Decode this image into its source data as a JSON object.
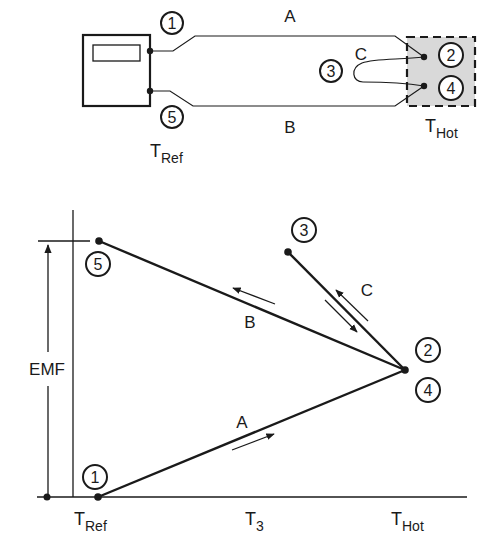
{
  "top_circuit": {
    "wire_labels": {
      "a": "A",
      "b": "B",
      "c": "C"
    },
    "points": {
      "p1": "1",
      "p2": "2",
      "p3": "3",
      "p4": "4",
      "p5": "5"
    },
    "ref_label": {
      "main": "T",
      "sub": "Ref"
    },
    "hot_label": {
      "main": "T",
      "sub": "Hot"
    }
  },
  "graph": {
    "y_axis_label": "EMF",
    "segment_labels": {
      "a": "A",
      "b": "B",
      "c": "C"
    },
    "points": {
      "p1": "1",
      "p2": "2",
      "p3": "3",
      "p4": "4",
      "p5": "5"
    },
    "x_ticks": [
      {
        "main": "T",
        "sub": "Ref"
      },
      {
        "main": "T",
        "sub": "3"
      },
      {
        "main": "T",
        "sub": "Hot"
      }
    ]
  },
  "colors": {
    "ink": "#1a1a1a",
    "hot_zone_fill": "#d9d9d9",
    "background": "#ffffff"
  }
}
